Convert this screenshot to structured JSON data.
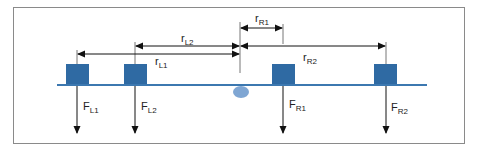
{
  "diagram": {
    "colors": {
      "frame": "#8a8a8a",
      "beam": "#3c78b0",
      "block": "#2f6aa3",
      "pivot": "#7fa6d3",
      "arrow": "#111111",
      "text": "#222222"
    },
    "distances": [
      {
        "id": "rR1",
        "main": "r",
        "sub": "R1"
      },
      {
        "id": "rL2",
        "main": "r",
        "sub": "L2"
      },
      {
        "id": "rL1",
        "main": "r",
        "sub": "L1"
      },
      {
        "id": "rR2",
        "main": "r",
        "sub": "R2"
      }
    ],
    "forces": [
      {
        "id": "FL1",
        "main": "F",
        "sub": "L1"
      },
      {
        "id": "FL2",
        "main": "F",
        "sub": "L2"
      },
      {
        "id": "FR1",
        "main": "F",
        "sub": "R1"
      },
      {
        "id": "FR2",
        "main": "F",
        "sub": "R2"
      }
    ]
  }
}
